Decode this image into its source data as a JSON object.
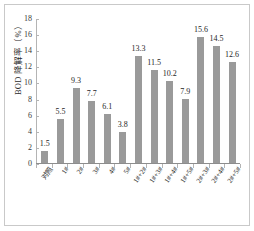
{
  "chart_data": {
    "type": "bar",
    "title": "",
    "xlabel": "",
    "ylabel": "BOD 降解率（%）",
    "ylim": [
      0,
      18
    ],
    "ytick_step": 2,
    "yticks": [
      18,
      16,
      14,
      12,
      10,
      8,
      6,
      4,
      2,
      0
    ],
    "grid": false,
    "legend": "none",
    "bar_color": "#9a9a9a",
    "categories": [
      "对照",
      "1#",
      "2#",
      "3#",
      "4#",
      "5#",
      "1#+2#",
      "1#+3#",
      "1#+4#",
      "1#+5#",
      "2#+3#",
      "2#+4#",
      "2#+5#"
    ],
    "values": [
      1.5,
      5.5,
      9.3,
      7.7,
      6.1,
      3.8,
      13.3,
      11.5,
      10.2,
      7.9,
      15.6,
      14.5,
      12.6
    ],
    "value_labels": [
      "1.5",
      "5.5",
      "9.3",
      "7.7",
      "6.1",
      "3.8",
      "13.3",
      "11.5",
      "10.2",
      "7.9",
      "15.6",
      "14.5",
      "12.6"
    ]
  },
  "figure": {
    "background_color": "#ffffff",
    "frame_color": "#c9c9c9",
    "axis_color": "#8d8d8d",
    "text_color": "#262626"
  }
}
